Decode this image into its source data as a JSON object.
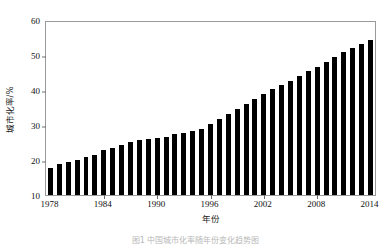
{
  "chart_data": {
    "type": "bar",
    "title": "",
    "xlabel": "年份",
    "ylabel": "城市化率/%",
    "ylim": [
      10,
      60
    ],
    "ytick_labels": [
      "10",
      "20",
      "30",
      "40",
      "50",
      "60"
    ],
    "ytick_values": [
      10,
      20,
      30,
      40,
      50,
      60
    ],
    "xtick_labels": [
      "1978",
      "1984",
      "1990",
      "1996",
      "2002",
      "2008",
      "2014"
    ],
    "xtick_values": [
      1978,
      1984,
      1990,
      1996,
      2002,
      2008,
      2014
    ],
    "grid": false,
    "legend": null,
    "bar_color": "#000000",
    "categories": [
      "1978",
      "1979",
      "1980",
      "1981",
      "1982",
      "1983",
      "1984",
      "1985",
      "1986",
      "1987",
      "1988",
      "1989",
      "1990",
      "1991",
      "1992",
      "1993",
      "1994",
      "1995",
      "1996",
      "1997",
      "1998",
      "1999",
      "2000",
      "2001",
      "2002",
      "2003",
      "2004",
      "2005",
      "2006",
      "2007",
      "2008",
      "2009",
      "2010",
      "2011",
      "2012",
      "2013",
      "2014"
    ],
    "values": [
      17.9,
      19.0,
      19.4,
      20.2,
      21.1,
      21.6,
      23.0,
      23.7,
      24.5,
      25.3,
      25.8,
      26.2,
      26.4,
      26.9,
      27.5,
      28.0,
      28.5,
      29.0,
      30.5,
      31.9,
      33.4,
      34.8,
      36.2,
      37.7,
      39.1,
      40.5,
      41.8,
      43.0,
      44.3,
      45.9,
      47.0,
      48.3,
      49.9,
      51.3,
      52.6,
      53.7,
      54.8
    ],
    "source_note": "中国城市化率历年变化"
  },
  "caption": {
    "text": "图1 中国城市化率随年份变化趋势图"
  }
}
